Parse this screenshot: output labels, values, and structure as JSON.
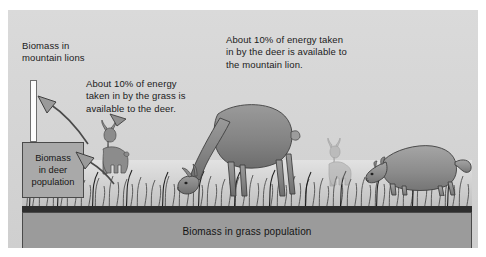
{
  "diagram": {
    "title_label_lion": "Biomass in\nmountain lions",
    "callout_grass_to_deer": "About 10% of energy\ntaken in by the grass is\navailable to the deer.",
    "callout_deer_to_lion": "About 10% of energy taken\nin by the deer is  available to\nthe mountain lion.",
    "box_deer_label": "Biomass\nin deer\npopulation",
    "box_grass_label": "Biomass in grass population",
    "levels": [
      {
        "name": "mountain-lion",
        "label": "Biomass in mountain lions",
        "relative_size": "smallest"
      },
      {
        "name": "deer",
        "label": "Biomass in deer population",
        "relative_size": "medium"
      },
      {
        "name": "grass",
        "label": "Biomass in grass population",
        "relative_size": "largest"
      }
    ],
    "transfer_efficiency": "About 10%",
    "animals": [
      {
        "name": "small-deer-standing"
      },
      {
        "name": "large-deer-grazing"
      },
      {
        "name": "background-deer"
      },
      {
        "name": "mountain-lion-prowling"
      }
    ],
    "colors": {
      "panel_background": "#d6d6d6",
      "lion_bar": "#fdfdfd",
      "deer_box": "#a9a9a9",
      "grass_box": "#9b9b9b",
      "outline": "#4a4a4a",
      "soil": "#2e2e2e",
      "text": "#1b1b1b"
    }
  }
}
